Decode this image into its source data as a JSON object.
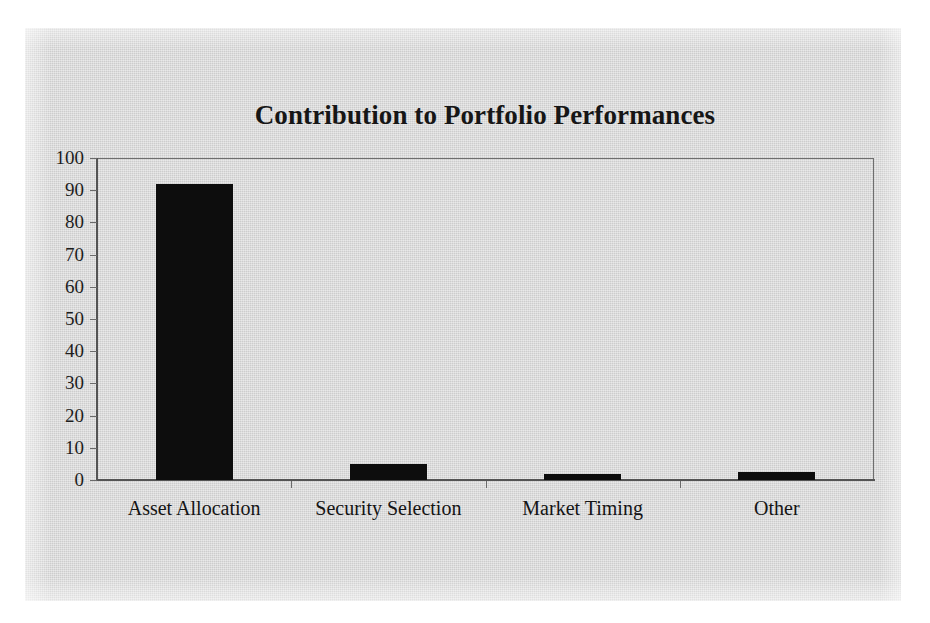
{
  "chart_data": {
    "type": "bar",
    "title": "Contribution to Portfolio Performances",
    "xlabel": "",
    "ylabel": "",
    "categories": [
      "Asset Allocation",
      "Security Selection",
      "Market Timing",
      "Other"
    ],
    "values": [
      92,
      5,
      2,
      2.5
    ],
    "ylim": [
      0,
      100
    ],
    "yticks": [
      0,
      10,
      20,
      30,
      40,
      50,
      60,
      70,
      80,
      90,
      100
    ],
    "ytick_labels": [
      "0",
      "10",
      "20",
      "30",
      "40",
      "50",
      "60",
      "70",
      "80",
      "90",
      "100"
    ],
    "grid": false,
    "legend": false,
    "series": [
      {
        "name": "Contribution",
        "values": [
          92,
          5,
          2,
          2.5
        ],
        "color": "#0d0d0d"
      }
    ],
    "colors": {
      "bar": "#0d0d0d",
      "axis": "#545454",
      "frame": "#6e6e6e",
      "text": "#161616",
      "paper": "#d4d4d4",
      "page": "#ffffff"
    }
  }
}
